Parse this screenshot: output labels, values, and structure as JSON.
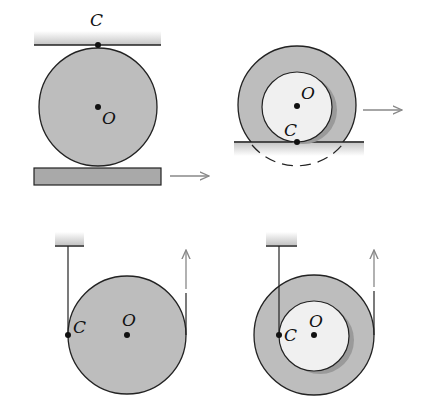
{
  "colors": {
    "disk_fill": "#bdbdbd",
    "inner_fill": "#f0f0f0",
    "shadow": "#9a9a9a",
    "stroke": "#222222",
    "arrow": "#888888",
    "plate": "#a9a9a9",
    "ground_shade": "#cfcfcf"
  },
  "panels": [
    {
      "id": "disk-between-plates",
      "labels": {
        "contact": "C",
        "center": "O"
      }
    },
    {
      "id": "wheel-rolling-on-ground",
      "labels": {
        "contact": "C",
        "center": "O"
      }
    },
    {
      "id": "disk-unwinding-string",
      "labels": {
        "contact": "C",
        "center": "O"
      }
    },
    {
      "id": "spool-unwinding-string",
      "labels": {
        "contact": "C",
        "center": "O"
      }
    }
  ]
}
